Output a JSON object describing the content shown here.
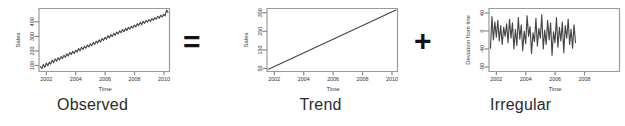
{
  "figure": {
    "background": "#ffffff",
    "line_color": "#444444",
    "axis_color": "#8a8a8a"
  },
  "operators": {
    "equals": "=",
    "plus": "+"
  },
  "panels": [
    {
      "caption": "Observed"
    },
    {
      "caption": "Trend"
    },
    {
      "caption": "Irregular"
    }
  ],
  "chart_data": [
    {
      "type": "line",
      "title": "Observed",
      "xlabel": "Time",
      "ylabel": "Sales",
      "xlim": [
        2001.5,
        2010.4
      ],
      "ylim": [
        40,
        430
      ],
      "xticks": [
        2002,
        2004,
        2006,
        2008,
        2010
      ],
      "yticks": [
        100,
        200,
        300,
        400
      ],
      "grid": false,
      "legend": "none",
      "x": [
        2001.6,
        2001.7,
        2001.8,
        2001.9,
        2002.0,
        2002.1,
        2002.2,
        2002.3,
        2002.4,
        2002.5,
        2002.6,
        2002.7,
        2002.8,
        2002.9,
        2003.0,
        2003.1,
        2003.2,
        2003.3,
        2003.4,
        2003.5,
        2003.6,
        2003.7,
        2003.8,
        2003.9,
        2004.0,
        2004.1,
        2004.2,
        2004.3,
        2004.4,
        2004.5,
        2004.6,
        2004.7,
        2004.8,
        2004.9,
        2005.0,
        2005.1,
        2005.2,
        2005.3,
        2005.4,
        2005.5,
        2005.6,
        2005.7,
        2005.8,
        2005.9,
        2006.0,
        2006.1,
        2006.2,
        2006.3,
        2006.4,
        2006.5,
        2006.6,
        2006.7,
        2006.8,
        2006.9,
        2007.0,
        2007.1,
        2007.2,
        2007.3,
        2007.4,
        2007.5,
        2007.6,
        2007.7,
        2007.8,
        2007.9,
        2008.0,
        2008.1,
        2008.2,
        2008.3,
        2008.4,
        2008.5,
        2008.6,
        2008.7,
        2008.8,
        2008.9,
        2009.0,
        2009.1,
        2009.2,
        2009.3,
        2009.4,
        2009.5,
        2009.6,
        2009.7,
        2009.8,
        2009.9,
        2010.0,
        2010.1,
        2010.2,
        2010.3
      ],
      "values": [
        70,
        58,
        84,
        66,
        92,
        75,
        98,
        86,
        110,
        95,
        118,
        104,
        125,
        112,
        132,
        120,
        140,
        128,
        150,
        136,
        158,
        145,
        165,
        152,
        172,
        160,
        182,
        168,
        190,
        176,
        196,
        184,
        204,
        192,
        212,
        200,
        220,
        208,
        228,
        216,
        236,
        222,
        244,
        232,
        252,
        240,
        262,
        248,
        268,
        256,
        276,
        264,
        284,
        272,
        292,
        280,
        300,
        286,
        308,
        294,
        314,
        302,
        320,
        310,
        328,
        316,
        336,
        324,
        344,
        330,
        350,
        338,
        356,
        346,
        362,
        350,
        368,
        358,
        374,
        364,
        382,
        370,
        388,
        378,
        394,
        384,
        420,
        406
      ]
    },
    {
      "type": "line",
      "title": "Trend",
      "xlabel": "Time",
      "ylabel": "Sales",
      "xlim": [
        2001.5,
        2010.4
      ],
      "ylim": [
        40,
        380
      ],
      "xticks": [
        2002,
        2004,
        2006,
        2008,
        2010
      ],
      "yticks": [
        50,
        150,
        250,
        350
      ],
      "grid": false,
      "legend": "none",
      "x": [
        2001.6,
        2010.3
      ],
      "values": [
        52,
        372
      ]
    },
    {
      "type": "line",
      "title": "Irregular",
      "xlabel": "Time",
      "ylabel": "Deviation from line",
      "xlim": [
        2001.5,
        2010.4
      ],
      "ylim": [
        -80,
        60
      ],
      "xticks": [
        2002,
        2004,
        2006,
        2008
      ],
      "yticks": [
        -80,
        -40,
        0,
        40
      ],
      "grid": false,
      "legend": "none",
      "x": [
        2001.6,
        2001.7,
        2001.8,
        2001.9,
        2002.0,
        2002.1,
        2002.2,
        2002.3,
        2002.4,
        2002.5,
        2002.6,
        2002.7,
        2002.8,
        2002.9,
        2003.0,
        2003.1,
        2003.2,
        2003.3,
        2003.4,
        2003.5,
        2003.6,
        2003.7,
        2003.8,
        2003.9,
        2004.0,
        2004.1,
        2004.2,
        2004.3,
        2004.4,
        2004.5,
        2004.6,
        2004.7,
        2004.8,
        2004.9,
        2005.0,
        2005.1,
        2005.2,
        2005.3,
        2005.4,
        2005.5,
        2005.6,
        2005.7,
        2005.8,
        2005.9,
        2006.0,
        2006.1,
        2006.2,
        2006.3,
        2006.4,
        2006.5,
        2006.6,
        2006.7,
        2006.8,
        2006.9,
        2007.0,
        2007.1,
        2007.2,
        2007.3,
        2007.4
      ],
      "values": [
        -28,
        42,
        -10,
        30,
        -4,
        34,
        -12,
        22,
        -20,
        18,
        -2,
        26,
        -16,
        36,
        -6,
        28,
        -30,
        14,
        -22,
        40,
        -8,
        24,
        -34,
        10,
        -18,
        44,
        -2,
        20,
        -40,
        6,
        -14,
        38,
        -24,
        16,
        -6,
        46,
        -30,
        12,
        -20,
        34,
        -10,
        28,
        -44,
        8,
        -16,
        40,
        -26,
        18,
        -12,
        30,
        -38,
        22,
        -6,
        36,
        -20,
        14,
        -28,
        24,
        -16
      ]
    }
  ]
}
